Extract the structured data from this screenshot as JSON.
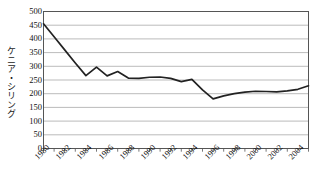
{
  "chart_data": {
    "type": "line",
    "title": "",
    "xlabel": "",
    "ylabel": "ケニア・シリング",
    "ylim": [
      0,
      500
    ],
    "ytick_values": [
      500,
      450,
      400,
      350,
      300,
      250,
      200,
      150,
      100,
      50,
      0
    ],
    "ytick_labels": [
      "500",
      "450",
      "400",
      "350",
      "300",
      "250",
      "200",
      "150",
      "100",
      "50",
      "0"
    ],
    "xlim": [
      1980,
      2005
    ],
    "xtick_labels": [
      "1980",
      "1982",
      "1984",
      "1986",
      "1988",
      "1990",
      "1992",
      "1994",
      "1996",
      "1998",
      "2000",
      "2002",
      "2004"
    ],
    "xtick_label_values": [
      1980,
      1982,
      1984,
      1986,
      1988,
      1990,
      1992,
      1994,
      1996,
      1998,
      2000,
      2002,
      2004
    ],
    "minor_tick_values": [
      1980,
      1981,
      1982,
      1983,
      1984,
      1985,
      1986,
      1987,
      1988,
      1989,
      1990,
      1991,
      1992,
      1993,
      1994,
      1995,
      1996,
      1997,
      1998,
      1999,
      2000,
      2001,
      2002,
      2003,
      2004,
      2005
    ],
    "grid": "horizontal",
    "legend": "none",
    "x": [
      1980,
      1981,
      1982,
      1983,
      1984,
      1985,
      1986,
      1987,
      1988,
      1989,
      1990,
      1991,
      1992,
      1993,
      1994,
      1995,
      1996,
      1997,
      1998,
      1999,
      2000,
      2001,
      2002,
      2003,
      2004,
      2005
    ],
    "series": [
      {
        "name": "ケニア・シリング",
        "color": "#222222",
        "values": [
          455,
          408,
          360,
          312,
          266,
          297,
          265,
          281,
          257,
          256,
          260,
          261,
          256,
          244,
          252,
          214,
          181,
          192,
          200,
          206,
          209,
          208,
          207,
          210,
          216,
          229
        ]
      }
    ],
    "series_tail_note": {
      "2003": 240,
      "2004": 243,
      "2005": 229
    },
    "colors": {
      "line": "#222222",
      "grid": "#aaaaaa",
      "frame": "#555555",
      "text": "#111111",
      "background": "#ffffff"
    }
  }
}
